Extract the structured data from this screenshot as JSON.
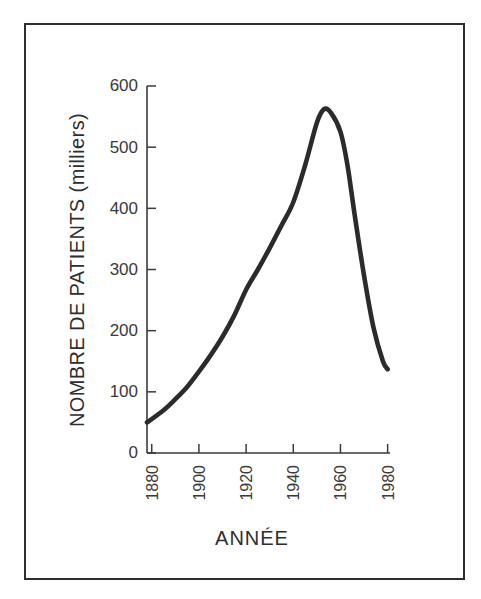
{
  "chart_data": {
    "type": "line",
    "title": "",
    "xlabel": "ANNÉE",
    "ylabel": "NOMBRE DE PATIENTS (milliers)",
    "xlim": [
      1878,
      1981
    ],
    "ylim": [
      0,
      600
    ],
    "grid": false,
    "legend": "none",
    "xticks": [
      "1880",
      "1900",
      "1920",
      "1940",
      "1960",
      "1980"
    ],
    "xtick_values": [
      1880,
      1900,
      1920,
      1940,
      1960,
      1980
    ],
    "yticks": [
      "0",
      "100",
      "200",
      "300",
      "400",
      "500",
      "600"
    ],
    "ytick_values": [
      0,
      100,
      200,
      300,
      400,
      500,
      600
    ],
    "series": [
      {
        "name": "Nombre de patients",
        "color": "#2b2b2b",
        "x": [
          1878,
          1885,
          1890,
          1895,
          1900,
          1905,
          1910,
          1915,
          1920,
          1925,
          1930,
          1935,
          1940,
          1945,
          1950,
          1953,
          1956,
          1960,
          1963,
          1966,
          1970,
          1974,
          1978,
          1980
        ],
        "values": [
          50,
          70,
          88,
          108,
          133,
          160,
          190,
          225,
          267,
          300,
          335,
          372,
          410,
          470,
          540,
          562,
          556,
          525,
          470,
          390,
          290,
          205,
          150,
          137
        ]
      }
    ]
  },
  "axes": {
    "y_axis_name": "y-axis",
    "x_axis_name": "x-axis"
  }
}
